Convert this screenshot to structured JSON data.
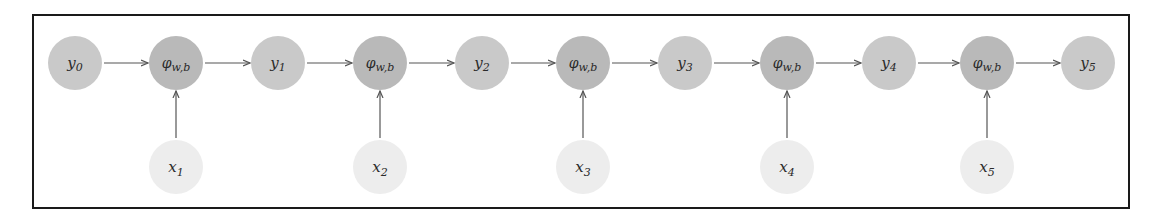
{
  "diagram": {
    "type": "recurrent-computation-graph",
    "frame": {
      "left": 32,
      "top": 14,
      "right": 1128,
      "bottom": 207
    },
    "colors": {
      "state_node_fill": "#c9c9c9",
      "function_node_fill": "#b9b9b9",
      "input_node_fill": "#ededed",
      "arrow": "#555555",
      "border": "#1a1a1a",
      "text": "#2a2a2a"
    },
    "row_y": 63,
    "input_row_y": 167,
    "radius": 27,
    "states": [
      {
        "id": "y0",
        "base": "y",
        "sub": "0",
        "cx": 75
      },
      {
        "id": "y1",
        "base": "y",
        "sub": "1",
        "cx": 278
      },
      {
        "id": "y2",
        "base": "y",
        "sub": "2",
        "cx": 482
      },
      {
        "id": "y3",
        "base": "y",
        "sub": "3",
        "cx": 685
      },
      {
        "id": "y4",
        "base": "y",
        "sub": "4",
        "cx": 889
      },
      {
        "id": "y5",
        "base": "y",
        "sub": "5",
        "cx": 1088
      }
    ],
    "functions": [
      {
        "id": "phi1",
        "base": "φ",
        "sub": "w,b",
        "cx": 176
      },
      {
        "id": "phi2",
        "base": "φ",
        "sub": "w,b",
        "cx": 380
      },
      {
        "id": "phi3",
        "base": "φ",
        "sub": "w,b",
        "cx": 583
      },
      {
        "id": "phi4",
        "base": "φ",
        "sub": "w,b",
        "cx": 787
      },
      {
        "id": "phi5",
        "base": "φ",
        "sub": "w,b",
        "cx": 987
      }
    ],
    "inputs": [
      {
        "id": "x1",
        "base": "x",
        "sub": "1",
        "cx": 176
      },
      {
        "id": "x2",
        "base": "x",
        "sub": "2",
        "cx": 380
      },
      {
        "id": "x3",
        "base": "x",
        "sub": "3",
        "cx": 583
      },
      {
        "id": "x4",
        "base": "x",
        "sub": "4",
        "cx": 787
      },
      {
        "id": "x5",
        "base": "x",
        "sub": "5",
        "cx": 987
      }
    ],
    "edges": [
      [
        "y0",
        "phi1"
      ],
      [
        "phi1",
        "y1"
      ],
      [
        "x1",
        "phi1"
      ],
      [
        "y1",
        "phi2"
      ],
      [
        "phi2",
        "y2"
      ],
      [
        "x2",
        "phi2"
      ],
      [
        "y2",
        "phi3"
      ],
      [
        "phi3",
        "y3"
      ],
      [
        "x3",
        "phi3"
      ],
      [
        "y3",
        "phi4"
      ],
      [
        "phi4",
        "y4"
      ],
      [
        "x4",
        "phi4"
      ],
      [
        "y4",
        "phi5"
      ],
      [
        "phi5",
        "y5"
      ],
      [
        "x5",
        "phi5"
      ]
    ]
  }
}
